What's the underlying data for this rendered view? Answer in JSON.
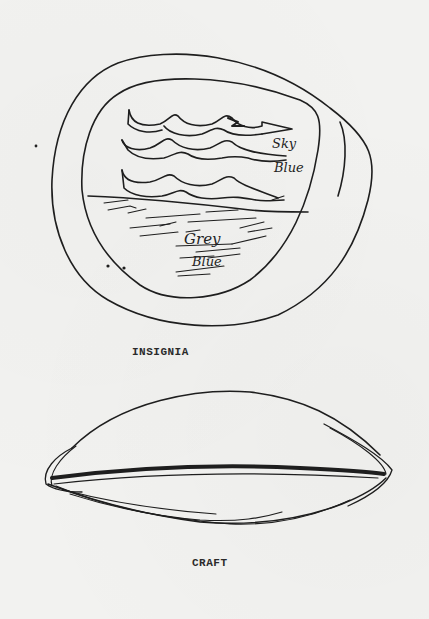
{
  "figure": {
    "insignia": {
      "caption": "INSIGNIA",
      "labels": {
        "sky_line1": "Sky",
        "sky_line2": "Blue",
        "ground_line1": "Grey",
        "ground_line2": "Blue"
      }
    },
    "craft": {
      "caption": "CRAFT"
    }
  },
  "colors": {
    "background": "#f2f2f0",
    "ink": "#1e1e1e"
  }
}
